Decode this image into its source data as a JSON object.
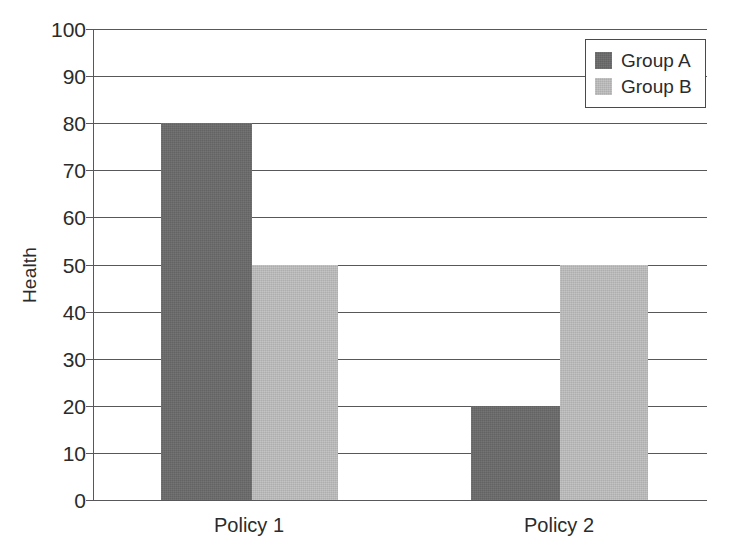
{
  "chart_data": {
    "type": "bar",
    "title": "",
    "xlabel": "",
    "ylabel": "Health",
    "categories": [
      "Policy 1",
      "Policy 2"
    ],
    "series": [
      {
        "name": "Group A",
        "color": "#6a6a6a",
        "values": [
          80,
          20
        ]
      },
      {
        "name": "Group B",
        "color": "#bdbdbd",
        "values": [
          50,
          50
        ]
      }
    ],
    "bars": [
      {
        "category": "Policy 1",
        "series": "Group A",
        "value": 80
      },
      {
        "category": "Policy 1",
        "series": "Group B",
        "value": 20
      },
      {
        "category": "Policy 2",
        "series": "Group A",
        "value": 50
      },
      {
        "category": "Policy 2",
        "series": "Group B",
        "value": 50
      }
    ],
    "ylim": [
      0,
      100
    ],
    "ytick_step": 10,
    "yticks": [
      100,
      90,
      80,
      70,
      60,
      50,
      40,
      30,
      20,
      10,
      0
    ],
    "ytick_labels": [
      "100",
      "90",
      "80",
      "70",
      "60",
      "50",
      "40",
      "30",
      "20",
      "10",
      "0"
    ],
    "grid": true,
    "grid_axis": "y",
    "legend_position": "top-right",
    "legend_entries": [
      "Group A",
      "Group B"
    ],
    "bar_gap": "adjacent",
    "colors": {
      "group_a": "#6a6a6a",
      "group_b": "#bdbdbd",
      "axis": "#58585a",
      "text": "#2b2b2b",
      "background": "#ffffff"
    }
  },
  "axis": {
    "y_title": "Health"
  },
  "legend": {
    "items": [
      {
        "label": "Group A",
        "color": "#6a6a6a"
      },
      {
        "label": "Group B",
        "color": "#bdbdbd"
      }
    ]
  },
  "x_labels": [
    {
      "text": "Policy 1",
      "x": 249
    },
    {
      "text": "Policy 2",
      "x": 559
    }
  ]
}
